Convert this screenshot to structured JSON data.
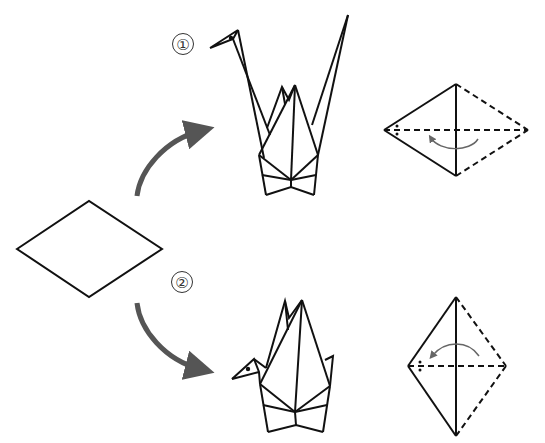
{
  "diagram": {
    "type": "origami-crane-folding-paths",
    "start_shape": "diamond-paper",
    "paths": [
      {
        "id": 1,
        "label": "①",
        "arrow_direction": "up-right",
        "result": "crane-with-raised-neck-and-wing",
        "fold_diagram": "horizontal-diamond-fold-left"
      },
      {
        "id": 2,
        "label": "②",
        "arrow_direction": "down-right",
        "result": "crane-with-folded-neck",
        "fold_diagram": "vertical-diamond-fold-left"
      }
    ],
    "colors": {
      "line": "#111111",
      "arrow": "#555555",
      "background": "#ffffff"
    }
  }
}
